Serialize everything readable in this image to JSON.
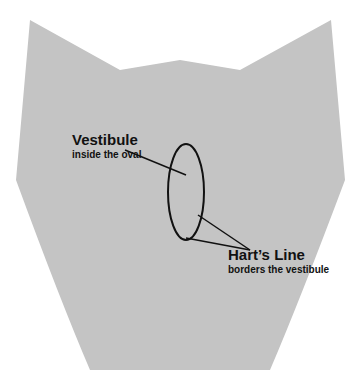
{
  "diagram": {
    "labels": [
      {
        "title": "Vestibule",
        "subtitle": "inside the oval"
      },
      {
        "title": "Hart’s Line",
        "subtitle": "borders the vestibule"
      }
    ],
    "colors": {
      "background": "#ffffff",
      "figure_fill": "#bdbdbd",
      "text": "#111111"
    }
  }
}
